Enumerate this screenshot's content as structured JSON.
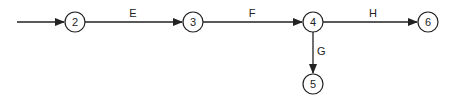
{
  "diagram": {
    "type": "activity-on-arrow network",
    "nodes": [
      {
        "id": "2",
        "label": "2",
        "x": 75,
        "y": 22
      },
      {
        "id": "3",
        "label": "3",
        "x": 193,
        "y": 22
      },
      {
        "id": "4",
        "label": "4",
        "x": 313,
        "y": 22
      },
      {
        "id": "5",
        "label": "5",
        "x": 313,
        "y": 84
      },
      {
        "id": "6",
        "label": "6",
        "x": 428,
        "y": 22
      }
    ],
    "edges": [
      {
        "from": null,
        "to": "2",
        "label": ""
      },
      {
        "from": "2",
        "to": "3",
        "label": "E"
      },
      {
        "from": "3",
        "to": "4",
        "label": "F"
      },
      {
        "from": "4",
        "to": "6",
        "label": "H"
      },
      {
        "from": "4",
        "to": "5",
        "label": "G"
      }
    ],
    "colors": {
      "stroke": "#222222",
      "background": "#ffffff"
    }
  }
}
